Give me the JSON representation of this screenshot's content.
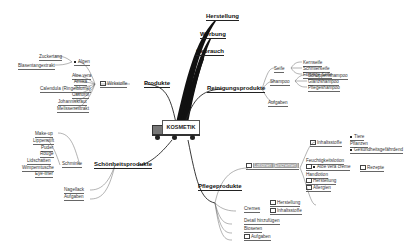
{
  "center": {
    "label": "KOSMETIK",
    "icon": "truck-icon"
  },
  "branches": {
    "herstellung": "Herstellung",
    "werbung": "Werbung",
    "gebrauch": "Gebrauch",
    "produkte": {
      "label": "Produkte",
      "wirkstoffe": {
        "label": "Wirkstoffe",
        "algen": {
          "label": "Algen",
          "children": [
            "Zuckertang",
            "Blasentangextrakt"
          ]
        },
        "children": [
          "Aloe vera",
          "Arnika",
          "Calendula (Ringelblume)",
          "Castorol",
          "Johanniskraut",
          "Melissenextrakt"
        ]
      }
    },
    "reinigung": {
      "label": "Reinigungsprodukte",
      "seife": {
        "label": "Seife",
        "children": [
          "Kernseife",
          "Schmierseife",
          "Flüssige Seife"
        ]
      },
      "shampoo": {
        "label": "Shampoo",
        "children": [
          "Schuppenshampoo",
          "Glanzshampoo",
          "Pflegeshampoo"
        ]
      },
      "aufgaben": "Aufgaben"
    },
    "schoenheit": {
      "label": "Schönheitsprodukte",
      "schminke": {
        "label": "Schminke",
        "children": [
          "Make-up",
          "Lippenstift",
          "Puder",
          "Rouge",
          "Lidschatten",
          "Wimperntusche",
          "Eye-liner"
        ]
      },
      "nagellack": "Nagellack",
      "aufgaben": "Aufgaben"
    },
    "pflege": {
      "label": "Pflegeprodukte",
      "lotionen": {
        "label": "Lotionen (Eincremen)",
        "inhaltsstoffe": {
          "label": "Inhaltsstoffe",
          "children": [
            "Tiere",
            "Pflanzen",
            "Gesundheitsgefährdend"
          ]
        },
        "children": [
          "Feuchtigkeitslotion",
          "Aloe vera creme",
          "Handlotion",
          "Herstellung",
          "Allergien"
        ],
        "rezepte": "Rezepte"
      },
      "cremes": {
        "label": "Cremes",
        "children": [
          "Herstellung",
          "Inhaltsstoffe"
        ]
      },
      "others": [
        "Detail hinzufügen",
        "Bioseren",
        "Aufgaben"
      ]
    }
  }
}
